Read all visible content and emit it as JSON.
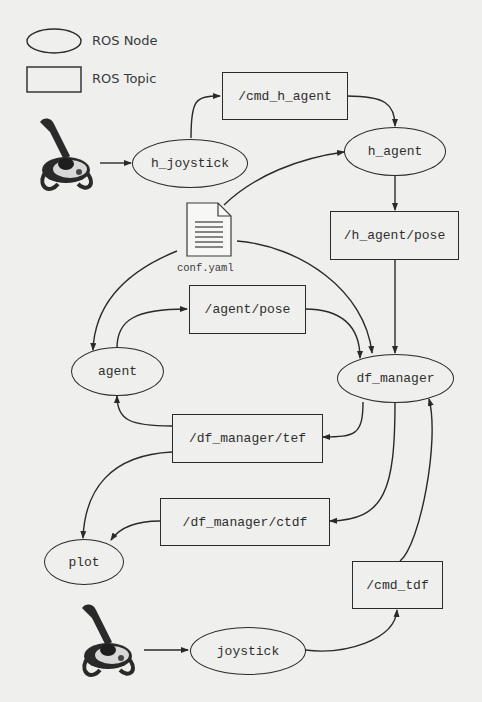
{
  "legend": {
    "node_label": "ROS Node",
    "topic_label": "ROS Topic"
  },
  "nodes": {
    "h_joystick": "h_joystick",
    "h_agent": "h_agent",
    "agent": "agent",
    "df_manager": "df_manager",
    "plot": "plot",
    "joystick": "joystick"
  },
  "topics": {
    "cmd_h_agent": "/cmd_h_agent",
    "h_agent_pose": "/h_agent/pose",
    "agent_pose": "/agent/pose",
    "df_manager_tef": "/df_manager/tef",
    "df_manager_ctdf": "/df_manager/ctdf",
    "cmd_tdf": "/cmd_tdf"
  },
  "config_file": {
    "label": "conf.yaml",
    "icon": "document-icon"
  },
  "devices": {
    "top_joystick_icon": "joystick-icon",
    "bottom_joystick_icon": "joystick-icon"
  },
  "edges": [
    {
      "from": "h_joystick_device",
      "to": "h_joystick"
    },
    {
      "from": "h_joystick",
      "to": "/cmd_h_agent"
    },
    {
      "from": "/cmd_h_agent",
      "to": "h_agent"
    },
    {
      "from": "conf.yaml",
      "to": "h_agent"
    },
    {
      "from": "h_agent",
      "to": "/h_agent/pose"
    },
    {
      "from": "/h_agent/pose",
      "to": "df_manager"
    },
    {
      "from": "conf.yaml",
      "to": "agent"
    },
    {
      "from": "conf.yaml",
      "to": "df_manager"
    },
    {
      "from": "agent",
      "to": "/agent/pose"
    },
    {
      "from": "/agent/pose",
      "to": "df_manager"
    },
    {
      "from": "df_manager",
      "to": "/df_manager/tef"
    },
    {
      "from": "/df_manager/tef",
      "to": "agent"
    },
    {
      "from": "/df_manager/tef",
      "to": "plot"
    },
    {
      "from": "df_manager",
      "to": "/df_manager/ctdf"
    },
    {
      "from": "/df_manager/ctdf",
      "to": "plot"
    },
    {
      "from": "joystick_device",
      "to": "joystick"
    },
    {
      "from": "joystick",
      "to": "/cmd_tdf"
    },
    {
      "from": "/cmd_tdf",
      "to": "df_manager"
    }
  ],
  "colors": {
    "background": "#efefed",
    "stroke": "#2a2a2a",
    "text": "#2e2e2e"
  }
}
